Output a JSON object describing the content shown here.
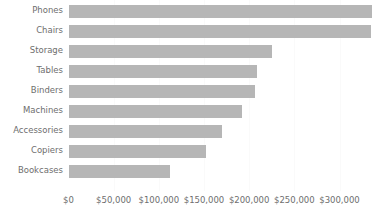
{
  "chart_data": {
    "type": "bar",
    "orientation": "horizontal",
    "title": "",
    "subtitle": "",
    "xlabel": "",
    "ylabel": "",
    "categories": [
      "Phones",
      "Chairs",
      "Storage",
      "Tables",
      "Binders",
      "Machines",
      "Accessories",
      "Copiers",
      "Bookcases"
    ],
    "values": [
      336000,
      335000,
      225000,
      209000,
      206000,
      192000,
      170000,
      152000,
      112000
    ],
    "series": [
      {
        "name": "Sales",
        "values": [
          336000,
          335000,
          225000,
          209000,
          206000,
          192000,
          170000,
          152000,
          112000
        ]
      }
    ],
    "xlim": [
      0,
      336000
    ],
    "axis_ticks": [
      0,
      50000,
      100000,
      150000,
      200000,
      250000,
      300000
    ],
    "tick_labels": [
      "$0",
      "$50,000",
      "$100,000",
      "$150,000",
      "$200,000",
      "$250,000",
      "$300,000"
    ],
    "grid": true,
    "grid_axis": "x",
    "legend": false,
    "legend_position": "none",
    "annotations": [],
    "bar_color": "#b6b6b6",
    "text_color": "#6e6e6e",
    "gridline_color": "#fafafa",
    "background_color": "#ffffff"
  },
  "axis": {
    "x_tick_labels": [
      "$0",
      "$50,000",
      "$100,000",
      "$150,000",
      "$200,000",
      "$250,000",
      "$300,000"
    ],
    "y_tick_labels": [
      "Phones",
      "Chairs",
      "Storage",
      "Tables",
      "Binders",
      "Machines",
      "Accessories",
      "Copiers",
      "Bookcases"
    ]
  }
}
